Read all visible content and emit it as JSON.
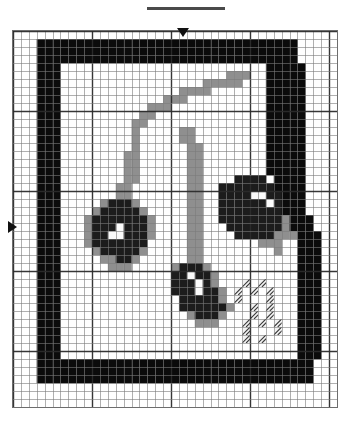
{
  "document": {
    "type": "cross-stitch-chart",
    "title_redacted": true,
    "title_placeholder": ""
  },
  "chart_frame": {
    "columns": 41,
    "rows": 47,
    "cell_px": 7.75,
    "bold_every": 10,
    "grid_line_color": "#7a7a7a",
    "bold_line_color": "#2b2b2b",
    "background_color": "#ffffff"
  },
  "markers": {
    "top_arrow": {
      "label": "center-column-marker",
      "column": 21
    },
    "left_arrow": {
      "label": "center-row-marker",
      "row": 24
    }
  },
  "palette": {
    "empty": "#ffffff",
    "black": "#0b0b0b",
    "dark": "#1c1c1c",
    "mid_dark": "#2e2e2e",
    "grey": "#8f8f8f",
    "light_grey": "#b4b4b4",
    "white_stitch": "#fbfbfb",
    "hatch_bg": "#f2f2f2",
    "hatch_line": "#3a3a3a"
  },
  "legend": {
    "symbols": [
      {
        "key": "black",
        "name": "solid-black-stitch",
        "color": "#0b0b0b"
      },
      {
        "key": "dark",
        "name": "dark-stitch",
        "color": "#1c1c1c"
      },
      {
        "key": "grey",
        "name": "grey-stitch",
        "color": "#8f8f8f"
      },
      {
        "key": "lgrey",
        "name": "light-grey-stitch",
        "color": "#b4b4b4"
      },
      {
        "key": "white",
        "name": "white-stitch",
        "color": "#fbfbfb"
      },
      {
        "key": "hatch",
        "name": "diagonal-hatch-stitch",
        "color": "#f2f2f2"
      }
    ]
  },
  "chart_data": {
    "type": "heatmap",
    "title": "",
    "xlabel": "",
    "ylabel": "",
    "columns": 41,
    "rows": 47,
    "legend_position": "none",
    "grid": true,
    "symbol_key": {
      ".": "empty",
      "K": "black",
      "D": "dark",
      "M": "mid_dark",
      "G": "grey",
      "L": "light_grey",
      "W": "white_stitch",
      "H": "hatch"
    },
    "cells": [
      ".........................................",
      "...KKKKKKKKKKKKKKKKKKKKKKKKKKKKKKKKK.....",
      "...KKKKKKKKKKKKKKKKKKKKKKKKKKKKKKKKK.....",
      "...KKKKKKKKKKKKKKKKKKKKKKKKKKKKKKKKK.....",
      "...KKK..........................KKKKK....",
      "...KKK.....................GGG..KKKKK....",
      "...KKK..................GGGGG...KKKKK....",
      "...KKK...............GGGG.......KKKKK....",
      "...KKK.............GGG..........KKKKK....",
      "...KKK...........GGG............KKKKK....",
      "...KKK..........GG..............KKKKK....",
      "...KKK.........GG...............KKKKK....",
      "...KKK.........G.....GG.........KKKKK....",
      "...KKK.........G.....GG.........KKKKK....",
      "...KKK.........G......GG........KKKKK....",
      "...KKK........GG......GG........KKKKK....",
      "...KKK........GG......GG........KKKKK....",
      "...KKK........GG......GG........KKKKK....",
      "...KKK........GG......GG....DDDD.KKKK....",
      "...KKK.......GG.......GG..DDDDDDDKKKK....",
      "...KKK.......GG.......GG..DDDDWWDDKKK....",
      "...KKK.....GDDDG......GG..DDDDDDWDKKK....",
      "...KKK....GDDDDDG.....GG..DDDDDDDDKKK....",
      "...KKK...GDDDDDDDG....GG..DDDDDDDDGKKK...",
      "...KKK...GDDDWDDDG....GG...DDDDDDDGKKK...",
      "...KKK...GDDWWDDDG....GG....DDDDDGGGKKK..",
      "...KKK...GDDDDDDD.....GG.......GGG..KKK..",
      "...KKK....GDDDDDG.....GG.........G..KKK..",
      "...KKK.....GGDDG......GG............KKK..",
      "...KKK......GGG.....GDDDG...........KKK..",
      "...KKK..............DDWDDG..........KKK..",
      "...KKK..............DDDWDG...H.H....KKK..",
      "...KKK..............DDDWDDG.H.H.H...KKK..",
      "...KKK...............DDDDDG.H...H...KKK..",
      "...KKK...............DDDDDDG..H.H...KKK..",
      "...KKK................GDDDG...H.H...KKK..",
      "...KKK.................GGG...H.H.H..KKK..",
      "...KKK.......................H...H..KKK..",
      "...KKK.......................H.H....KKK..",
      "...KKK..............................KKK..",
      "...KKK..............................KKK..",
      "...KKKKKKKKKKKKKKKKKKKKKKKKKKKKKKKKKKK..",
      "...KKKKKKKKKKKKKKKKKKKKKKKKKKKKKKKKKKK..",
      "...KKKKKKKKKKKKKKKKKKKKKKKKKKKKKKKKKKK..",
      ".........................................",
      ".........................................",
      "........................................."
    ]
  }
}
